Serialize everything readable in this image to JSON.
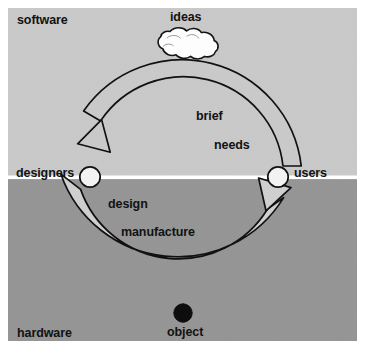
{
  "diagram": {
    "type": "cycle-diagram",
    "regions": [
      {
        "key": "software",
        "label": "software",
        "fill": "#c9c9c9",
        "span_y": [
          8,
          177
        ]
      },
      {
        "key": "hardware",
        "label": "hardware",
        "fill": "#959595",
        "span_y": [
          180,
          341
        ]
      }
    ],
    "divider": {
      "color": "#ffffff",
      "y": 178,
      "thickness": 3
    },
    "nodes": [
      {
        "key": "designers",
        "label": "designers",
        "shape": "circle",
        "fill": "#f2f2f2",
        "stroke": "#111111",
        "cx": 90,
        "cy": 177,
        "r": 10
      },
      {
        "key": "users",
        "label": "users",
        "shape": "circle",
        "fill": "#f2f2f2",
        "stroke": "#111111",
        "cx": 278,
        "cy": 177,
        "r": 10
      },
      {
        "key": "ideas",
        "label": "ideas",
        "shape": "cloud",
        "fill": "#fdfdfd",
        "stroke": "#111111",
        "cx": 188,
        "cy": 43
      },
      {
        "key": "object",
        "label": "object",
        "shape": "disc",
        "fill": "#0d0d0d",
        "stroke": "#0d0d0d",
        "cx": 183,
        "cy": 313,
        "r": 9
      }
    ],
    "flows": [
      {
        "key": "upper",
        "from": "users",
        "to": "designers",
        "direction": "counter-clockwise",
        "style": "outline",
        "fill": "#c9c9c9",
        "stroke": "#111111",
        "labels": [
          "brief",
          "needs"
        ]
      },
      {
        "key": "lower",
        "from": "designers",
        "to": "users",
        "direction": "counter-clockwise",
        "style": "filled",
        "fill": "#cfcfcf",
        "stroke": "#111111",
        "labels": [
          "design",
          "manufacture"
        ]
      }
    ],
    "labels": {
      "software": "software",
      "hardware": "hardware",
      "ideas": "ideas",
      "designers": "designers",
      "users": "users",
      "brief": "brief",
      "needs": "needs",
      "design": "design",
      "manufacture": "manufacture",
      "object": "object"
    },
    "colors": {
      "software_band": "#c9c9c9",
      "hardware_band": "#959595",
      "divider": "#ffffff",
      "ink": "#111111",
      "node_fill": "#f2f2f2",
      "object_fill": "#0d0d0d",
      "arrow_fill": "#cfcfcf",
      "page": "#ffffff"
    }
  }
}
